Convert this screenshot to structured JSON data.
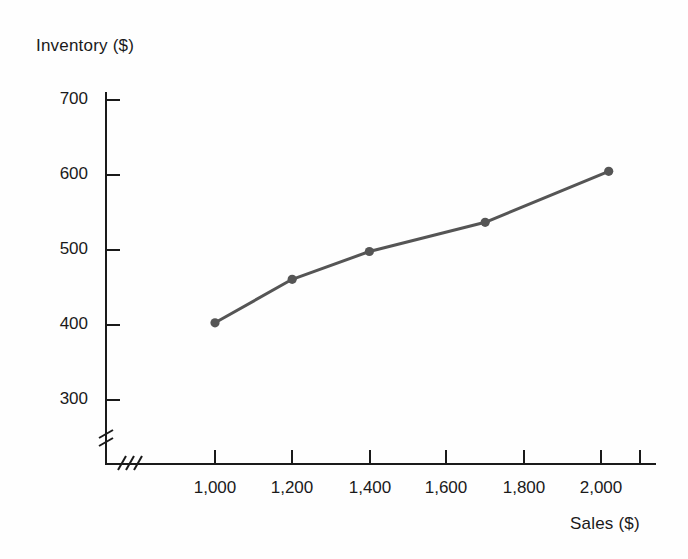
{
  "chart_data": {
    "type": "line",
    "title": "",
    "subtitle": "",
    "xlabel": "Sales ($)",
    "ylabel": "Inventory ($)",
    "xlim": [
      900,
      2100
    ],
    "ylim": [
      250,
      720
    ],
    "xticks": [
      1000,
      1200,
      1400,
      1600,
      1800,
      2000
    ],
    "xtick_labels": [
      "1,000",
      "1,200",
      "1,400",
      "1,600",
      "1,800",
      "2,000"
    ],
    "yticks": [
      300,
      400,
      500,
      600,
      700
    ],
    "ytick_labels": [
      "300",
      "400",
      "500",
      "600",
      "700"
    ],
    "grid": false,
    "legend": false,
    "axis_break_x": true,
    "axis_break_y": true,
    "annotations": [],
    "x": [
      1000,
      1200,
      1400,
      1700,
      2020
    ],
    "values": [
      403,
      461,
      498,
      537,
      605
    ],
    "series": [
      {
        "name": "Inventory vs Sales",
        "x": [
          1000,
          1200,
          1400,
          1700,
          2020
        ],
        "values": [
          403,
          461,
          498,
          537,
          605
        ],
        "color": "#555555",
        "marker": "circle"
      }
    ]
  },
  "colors": {
    "line": "#555555",
    "marker": "#555555",
    "axis": "#1a1a1a",
    "text": "#1a1a1a",
    "background": "#fefefe"
  },
  "axis_labels": {
    "y_title": "Inventory ($)",
    "x_title": "Sales ($)"
  },
  "y_tick_labels": [
    "700",
    "600",
    "500",
    "400",
    "300"
  ],
  "x_tick_labels": [
    "1,000",
    "1,200",
    "1,400",
    "1,600",
    "1,800",
    "2,000"
  ]
}
